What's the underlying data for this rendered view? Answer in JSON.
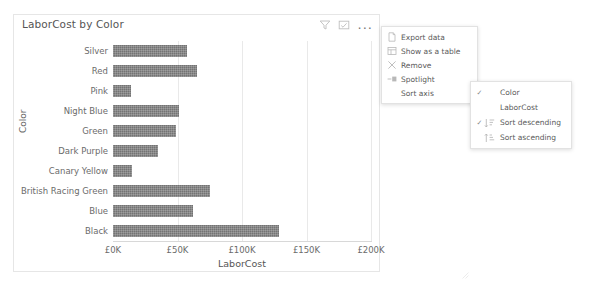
{
  "card": {
    "title": "LaborCost by Color",
    "header_icons": [
      {
        "name": "filter-icon",
        "glyph": "filter"
      },
      {
        "name": "focus-mode-icon",
        "glyph": "focus"
      },
      {
        "name": "more-options-icon",
        "glyph": "..."
      }
    ]
  },
  "menu": {
    "items": [
      {
        "label": "Export data",
        "icon": "export-data-icon",
        "submenu": false
      },
      {
        "label": "Show as a table",
        "icon": "table-icon",
        "submenu": false
      },
      {
        "label": "Remove",
        "icon": "remove-icon",
        "submenu": false
      },
      {
        "label": "Spotlight",
        "icon": "spotlight-icon",
        "submenu": false
      },
      {
        "label": "Sort axis",
        "icon": "",
        "submenu": true,
        "arrow": "›"
      }
    ]
  },
  "submenu": {
    "items": [
      {
        "label": "Color",
        "checked": true,
        "icon": ""
      },
      {
        "label": "LaborCost",
        "checked": false,
        "icon": ""
      },
      {
        "label": "Sort descending",
        "checked": true,
        "icon": "sort-descending-icon"
      },
      {
        "label": "Sort ascending",
        "checked": false,
        "icon": "sort-ascending-icon"
      }
    ],
    "check_glyph": "✓"
  },
  "chart_data": {
    "type": "bar",
    "orientation": "horizontal",
    "title": "LaborCost by Color",
    "xlabel": "LaborCost",
    "ylabel": "Color",
    "categories": [
      "Silver",
      "Red",
      "Pink",
      "Night Blue",
      "Green",
      "Dark Purple",
      "Canary Yellow",
      "British Racing Green",
      "Blue",
      "Black"
    ],
    "values": [
      57000,
      65000,
      14000,
      51000,
      49000,
      35000,
      15000,
      75000,
      62000,
      129000
    ],
    "xlim": [
      0,
      200000
    ],
    "xticks": [
      0,
      50000,
      100000,
      150000,
      200000
    ],
    "xtick_labels": [
      "£0K",
      "£50K",
      "£100K",
      "£150K",
      "£200K"
    ],
    "grid": true,
    "legend": false,
    "bar_color": "#737373"
  }
}
